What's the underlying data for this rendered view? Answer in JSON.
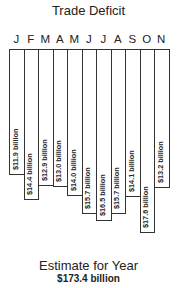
{
  "title": "Trade Deficit",
  "footer": {
    "label": "Estimate for Year",
    "value": "$173.4 billion"
  },
  "chart_data": {
    "type": "bar",
    "orientation": "vertical-hanging",
    "title": "Trade Deficit",
    "categories": [
      "J",
      "F",
      "M",
      "A",
      "M",
      "J",
      "J",
      "A",
      "S",
      "O",
      "N"
    ],
    "values": [
      11.9,
      14.4,
      12.9,
      13.0,
      14.0,
      15.7,
      16.5,
      15.7,
      14.1,
      17.6,
      13.2
    ],
    "labels": [
      "$11.9 billion",
      "$14.4 billion",
      "$12.9 billion",
      "$13.0 billion",
      "$14.0 billion",
      "$15.7 billion",
      "$16.5 billion",
      "$15.7 billion",
      "$14.1 billion",
      "$17.6 billion",
      "$13.2 billion"
    ],
    "unit": "billion USD",
    "xlabel": "",
    "ylabel": "",
    "grid": false,
    "legend": null,
    "annotation": "Estimate for Year $173.4 billion",
    "bar_bottoms_px": [
      126,
      151,
      137,
      138,
      147,
      165,
      172,
      165,
      148,
      184,
      139
    ]
  }
}
